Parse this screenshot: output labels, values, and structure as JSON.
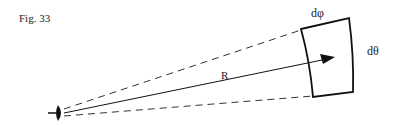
{
  "figure": {
    "caption": "Fig. 33",
    "labels": {
      "radius": "R",
      "d_phi": "dφ",
      "d_theta": "dθ"
    },
    "elements": {
      "observer": "eye-icon",
      "vector": "R arrow from observer to surface patch",
      "patch": "curved surface element dφ × dθ",
      "cone": "dashed lines bounding solid angle"
    }
  }
}
